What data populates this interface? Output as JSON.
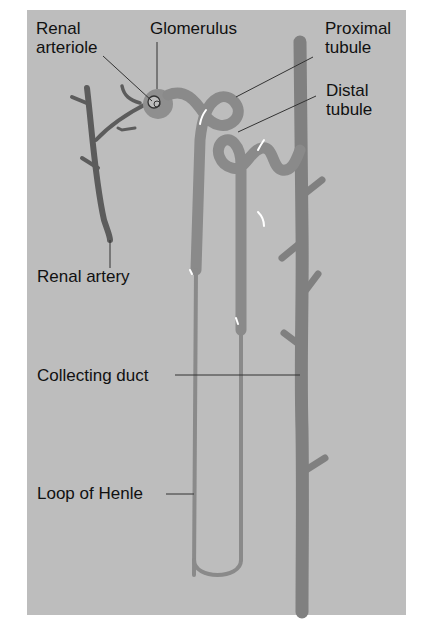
{
  "figure": {
    "background_color": "#bdbdbd",
    "vessel_color": "#5c5c5c",
    "tubule_color": "#8a8a8a",
    "duct_color": "#808080",
    "glomerulus_color": "#8f8f8f",
    "label_color": "#111111"
  },
  "labels": {
    "renal_arteriole": "Renal\narteriole",
    "glomerulus": "Glomerulus",
    "proximal_tubule": "Proximal\ntubule",
    "distal_tubule": "Distal\ntubule",
    "renal_artery": "Renal artery",
    "collecting_duct": "Collecting duct",
    "loop_of_henle": "Loop of Henle"
  }
}
